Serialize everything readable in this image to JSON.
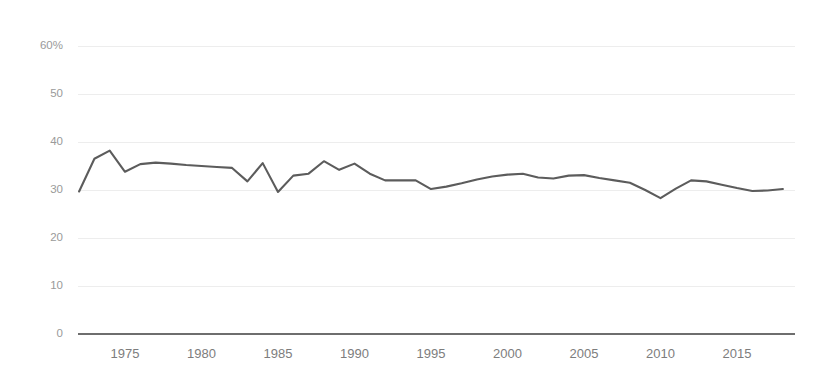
{
  "chart_data": {
    "type": "line",
    "title": "",
    "subtitle": "",
    "xlabel": "",
    "ylabel": "",
    "xlim": [
      1972,
      2018
    ],
    "ylim": [
      0,
      60
    ],
    "grid": true,
    "legend": false,
    "y_ticks": [
      0,
      10,
      20,
      30,
      40,
      50,
      60
    ],
    "y_tick_labels": [
      "0",
      "10",
      "20",
      "30",
      "40",
      "50",
      "60%"
    ],
    "x_ticks": [
      1975,
      1980,
      1985,
      1990,
      1995,
      2000,
      2005,
      2010,
      2015
    ],
    "x_tick_labels": [
      "1975",
      "1980",
      "1985",
      "1990",
      "1995",
      "2000",
      "2005",
      "2010",
      "2015"
    ],
    "line_color": "#5c5c5c",
    "grid_color": "#ededed",
    "axis_color": "#6e6e6e",
    "tick_label_color": "#7d7d7d",
    "x": [
      1972,
      1973,
      1974,
      1975,
      1976,
      1977,
      1978,
      1979,
      1980,
      1981,
      1982,
      1983,
      1984,
      1985,
      1986,
      1987,
      1988,
      1989,
      1990,
      1991,
      1992,
      1993,
      1994,
      1995,
      1996,
      1997,
      1998,
      1999,
      2000,
      2001,
      2002,
      2003,
      2004,
      2005,
      2006,
      2007,
      2008,
      2009,
      2010,
      2011,
      2012,
      2013,
      2014,
      2015,
      2016,
      2017,
      2018
    ],
    "values": [
      29.7,
      36.5,
      38.2,
      33.8,
      35.4,
      35.7,
      35.5,
      35.2,
      35.0,
      34.8,
      34.6,
      31.8,
      35.6,
      29.6,
      33.0,
      33.4,
      36.0,
      34.2,
      35.5,
      33.4,
      32.0,
      32.0,
      32.0,
      30.2,
      30.7,
      31.4,
      32.2,
      32.8,
      33.2,
      33.4,
      32.6,
      32.4,
      33.0,
      33.1,
      32.5,
      32.0,
      31.5,
      30.0,
      28.3,
      30.3,
      32.0,
      31.8,
      31.1,
      30.4,
      29.8,
      29.9,
      30.2
    ],
    "series": [
      {
        "name": "series-1",
        "values": [
          29.7,
          36.5,
          38.2,
          33.8,
          35.4,
          35.7,
          35.5,
          35.2,
          35.0,
          34.8,
          34.6,
          31.8,
          35.6,
          29.6,
          33.0,
          33.4,
          36.0,
          34.2,
          35.5,
          33.4,
          32.0,
          32.0,
          32.0,
          30.2,
          30.7,
          31.4,
          32.2,
          32.8,
          33.2,
          33.4,
          32.6,
          32.4,
          33.0,
          33.1,
          32.5,
          32.0,
          31.5,
          30.0,
          28.3,
          30.3,
          32.0,
          31.8,
          31.1,
          30.4,
          29.8,
          29.9,
          30.2
        ]
      }
    ]
  }
}
